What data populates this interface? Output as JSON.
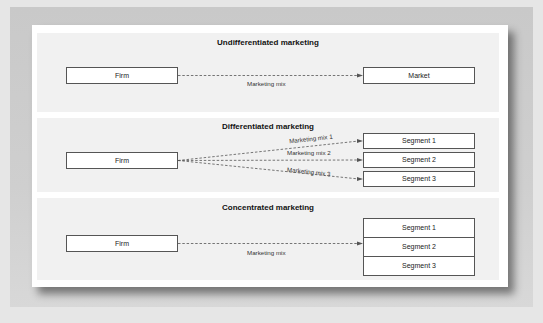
{
  "diagram": {
    "sections": [
      {
        "title": "Undifferentiated marketing",
        "source": "Firm",
        "targets": [
          "Market"
        ],
        "links": [
          "Marketing mix"
        ]
      },
      {
        "title": "Differentiated marketing",
        "source": "Firm",
        "targets": [
          "Segment 1",
          "Segment 2",
          "Segment 3"
        ],
        "links": [
          "Marketing mix 1",
          "Marketing mix 2",
          "Marketing mix 3"
        ]
      },
      {
        "title": "Concentrated marketing",
        "source": "Firm",
        "targets": [
          "Segment 1",
          "Segment 2",
          "Segment 3"
        ],
        "links": [
          "Marketing mix"
        ]
      }
    ],
    "colors": {
      "band": "#f1f1f1",
      "box_border": "#555555",
      "arrow": "#555555",
      "frame": "#c9c9c9"
    }
  }
}
